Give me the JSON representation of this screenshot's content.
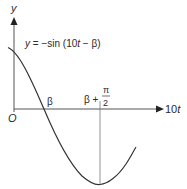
{
  "diagram": {
    "type": "function-graph",
    "y_axis_label": "y",
    "x_axis_label_coef": "10",
    "x_axis_label_var": "t",
    "origin_label": "O",
    "equation": {
      "lhs": "y",
      "eq": " = −sin (10",
      "var": "t",
      "tail": " − β)"
    },
    "x_intercept_label": "β",
    "min_label": {
      "base": "β +",
      "numerator": "π",
      "denominator": "2"
    },
    "colors": {
      "axis": "#555555",
      "curve": "#333333",
      "text": "#2a2a2a"
    }
  }
}
